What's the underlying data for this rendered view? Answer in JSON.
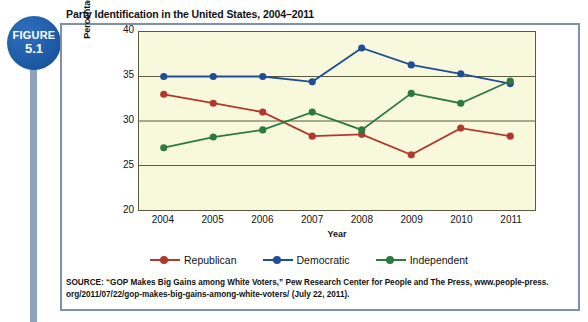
{
  "badge": {
    "word": "FIGURE",
    "number": "5.1"
  },
  "title": "Party Identification in the United States, 2004–2011",
  "source": {
    "line1": "SOURCE: “GOP Makes Big Gains among White Voters,” Pew Research Center for People and The Press, www.people-press.",
    "line2": "org/2011/07/22/gop-makes-big-gains-among-white-voters/ (July 22, 2011)."
  },
  "legend": [
    {
      "label": "Republican",
      "color": "#b0392c"
    },
    {
      "label": "Democratic",
      "color": "#1f4e96"
    },
    {
      "label": "Independent",
      "color": "#2c7a3f"
    }
  ],
  "chart_data": {
    "type": "line",
    "title": "Party Identification in the United States, 2004–2011",
    "xlabel": "Year",
    "ylabel": "Percentage of Voting Age Population",
    "categories": [
      "2004",
      "2005",
      "2006",
      "2007",
      "2008",
      "2009",
      "2010",
      "2011"
    ],
    "x": [
      2004,
      2005,
      2006,
      2007,
      2008,
      2009,
      2010,
      2011
    ],
    "ylim": [
      20,
      40
    ],
    "yticks": [
      20,
      25,
      30,
      35,
      40
    ],
    "grid": true,
    "legend_position": "bottom",
    "series": [
      {
        "name": "Republican",
        "color": "#b0392c",
        "values": [
          33.0,
          32.0,
          31.0,
          28.3,
          28.5,
          26.2,
          29.2,
          28.3
        ]
      },
      {
        "name": "Democratic",
        "color": "#1f4e96",
        "values": [
          35.0,
          35.0,
          35.0,
          34.4,
          38.2,
          36.3,
          35.3,
          34.2
        ]
      },
      {
        "name": "Independent",
        "color": "#2c7a3f",
        "values": [
          27.0,
          28.2,
          29.0,
          31.0,
          29.0,
          33.1,
          32.0,
          34.5
        ]
      }
    ]
  }
}
